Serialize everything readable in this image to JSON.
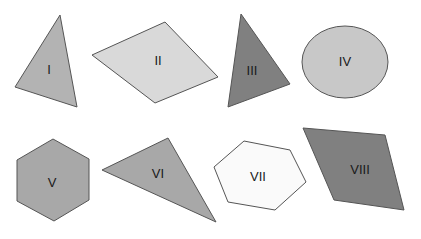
{
  "figure": {
    "width": 421,
    "height": 239,
    "background": "#ffffff",
    "stroke": "#555555"
  },
  "shapes": [
    {
      "label": "I",
      "kind": "triangle",
      "fill": "#b3b3b3",
      "points": "60,15 15,87 77,107",
      "label_pos": [
        49,
        71
      ]
    },
    {
      "label": "II",
      "kind": "rhombus",
      "fill": "#d9d9d9",
      "points": "92,55 165,22 218,77 155,103",
      "label_pos": [
        158,
        62
      ]
    },
    {
      "label": "III",
      "kind": "triangle",
      "fill": "#808080",
      "points": "241,14 290,84 228,107",
      "label_pos": [
        252,
        72
      ]
    },
    {
      "label": "IV",
      "kind": "ellipse",
      "fill": "#c8c8c8",
      "cx": 345,
      "cy": 62,
      "rx": 43,
      "ry": 36,
      "label_pos": [
        345,
        63
      ]
    },
    {
      "label": "V",
      "kind": "hexagon",
      "fill": "#a8a8a8",
      "points": "53,139 89,159 89,200 54,221 17,201 17,160",
      "label_pos": [
        52,
        184
      ]
    },
    {
      "label": "VI",
      "kind": "triangle",
      "fill": "#a8a8a8",
      "points": "102,170 168,138 216,222",
      "label_pos": [
        158,
        175
      ]
    },
    {
      "label": "VII",
      "kind": "hexagon",
      "fill": "#fafafa",
      "points": "244,141 290,150 306,182 275,210 228,202 214,167",
      "label_pos": [
        258,
        178
      ]
    },
    {
      "label": "VIII",
      "kind": "parallelogram",
      "fill": "#808080",
      "points": "303,128 385,135 404,210 334,200",
      "label_pos": [
        360,
        171
      ]
    }
  ]
}
